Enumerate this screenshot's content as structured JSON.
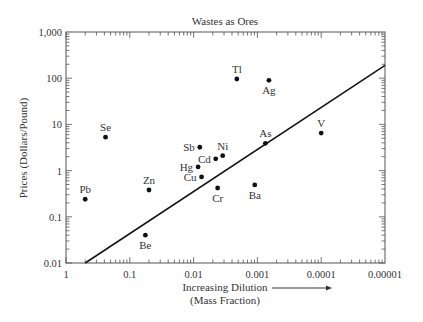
{
  "chart_data": {
    "type": "scatter",
    "title": "Wastes as Ores",
    "xlabel": "Increasing Dilution",
    "xlabel_sub": "(Mass Fraction)",
    "ylabel": "Prices (Dollars/Pound)",
    "x_scale": "log",
    "y_scale": "log",
    "x_reversed": true,
    "xlim": [
      1,
      1e-05
    ],
    "ylim": [
      0.01,
      1000
    ],
    "x_ticks": [
      {
        "value": 1,
        "label": "1"
      },
      {
        "value": 0.1,
        "label": "0.1"
      },
      {
        "value": 0.01,
        "label": "0.01"
      },
      {
        "value": 0.001,
        "label": "0.001"
      },
      {
        "value": 0.0001,
        "label": "0.0001"
      },
      {
        "value": 1e-05,
        "label": "0.00001"
      }
    ],
    "y_ticks": [
      {
        "value": 0.01,
        "label": "0.01"
      },
      {
        "value": 0.1,
        "label": "0.1"
      },
      {
        "value": 1,
        "label": "1"
      },
      {
        "value": 10,
        "label": "10"
      },
      {
        "value": 100,
        "label": "100"
      },
      {
        "value": 1000,
        "label": "1,000"
      }
    ],
    "grid": false,
    "legend": null,
    "points": [
      {
        "label": "Pb",
        "x": 0.5,
        "y": 0.24,
        "label_pos": "above"
      },
      {
        "label": "Se",
        "x": 0.24,
        "y": 5.3,
        "label_pos": "above"
      },
      {
        "label": "Zn",
        "x": 0.05,
        "y": 0.38,
        "label_pos": "above"
      },
      {
        "label": "Be",
        "x": 0.057,
        "y": 0.04,
        "label_pos": "below"
      },
      {
        "label": "Sb",
        "x": 0.008,
        "y": 3.2,
        "label_pos": "left"
      },
      {
        "label": "Ni",
        "x": 0.0035,
        "y": 2.1,
        "label_pos": "above"
      },
      {
        "label": "Cd",
        "x": 0.0045,
        "y": 1.8,
        "label_pos": "left"
      },
      {
        "label": "Hg",
        "x": 0.0085,
        "y": 1.2,
        "label_pos": "left"
      },
      {
        "label": "Cu",
        "x": 0.0075,
        "y": 0.73,
        "label_pos": "left"
      },
      {
        "label": "Cr",
        "x": 0.0042,
        "y": 0.42,
        "label_pos": "below"
      },
      {
        "label": "Ba",
        "x": 0.0011,
        "y": 0.49,
        "label_pos": "below"
      },
      {
        "label": "As",
        "x": 0.00075,
        "y": 3.9,
        "label_pos": "above"
      },
      {
        "label": "Tl",
        "x": 0.0021,
        "y": 96,
        "label_pos": "above"
      },
      {
        "label": "Ag",
        "x": 0.00066,
        "y": 90,
        "label_pos": "below"
      },
      {
        "label": "V",
        "x": 0.0001,
        "y": 6.5,
        "label_pos": "above"
      }
    ],
    "trend_line": {
      "x": [
        0.5,
        1e-05
      ],
      "y": [
        0.01,
        190
      ]
    },
    "colors": {
      "axis": "#555555",
      "point": "#111111",
      "line": "#111111",
      "text": "#333333"
    }
  }
}
